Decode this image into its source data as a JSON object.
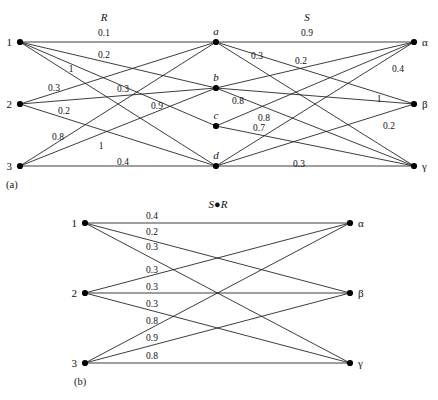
{
  "figure": {
    "panel_a": {
      "caption": "(a)",
      "relation_left_title": "R",
      "relation_right_title": "S",
      "left_nodes": [
        {
          "id": "1",
          "label": "1",
          "x": 20,
          "y": 42
        },
        {
          "id": "2",
          "label": "2",
          "x": 20,
          "y": 104
        },
        {
          "id": "3",
          "label": "3",
          "x": 20,
          "y": 166
        }
      ],
      "middle_nodes": [
        {
          "id": "a",
          "label": "a",
          "x": 216,
          "y": 42
        },
        {
          "id": "b",
          "label": "b",
          "x": 216,
          "y": 88
        },
        {
          "id": "c",
          "label": "c",
          "x": 216,
          "y": 126
        },
        {
          "id": "d",
          "label": "d",
          "x": 216,
          "y": 166
        }
      ],
      "right_nodes": [
        {
          "id": "alpha",
          "label": "α",
          "x": 414,
          "y": 42
        },
        {
          "id": "beta",
          "label": "β",
          "x": 414,
          "y": 104
        },
        {
          "id": "gamma",
          "label": "γ",
          "x": 414,
          "y": 166
        }
      ],
      "R_edges": [
        {
          "from": "1",
          "to": "a",
          "weight": "0.1"
        },
        {
          "from": "1",
          "to": "b",
          "weight": "0.2"
        },
        {
          "from": "1",
          "to": "c",
          "weight": "1"
        },
        {
          "from": "1",
          "to": "d",
          "weight": "0.3"
        },
        {
          "from": "2",
          "to": "a",
          "weight": "0.3"
        },
        {
          "from": "2",
          "to": "b",
          "weight": "0.9"
        },
        {
          "from": "2",
          "to": "d",
          "weight": "0.2"
        },
        {
          "from": "3",
          "to": "a",
          "weight": "0.8"
        },
        {
          "from": "3",
          "to": "b",
          "weight": "1"
        },
        {
          "from": "3",
          "to": "d",
          "weight": "0.4"
        }
      ],
      "S_edges": [
        {
          "from": "a",
          "to": "alpha",
          "weight": "0.9"
        },
        {
          "from": "a",
          "to": "beta",
          "weight": "0.3"
        },
        {
          "from": "a",
          "to": "gamma",
          "weight": "0.2"
        },
        {
          "from": "b",
          "to": "alpha",
          "weight": "0.4"
        },
        {
          "from": "b",
          "to": "beta",
          "weight": "1"
        },
        {
          "from": "b",
          "to": "gamma",
          "weight": "0.8"
        },
        {
          "from": "c",
          "to": "alpha",
          "weight": "0.8"
        },
        {
          "from": "c",
          "to": "gamma",
          "weight": "0.7"
        },
        {
          "from": "d",
          "to": "alpha",
          "weight": "0.2"
        },
        {
          "from": "d",
          "to": "beta",
          "weight": "0.3"
        },
        {
          "from": "d",
          "to": "gamma",
          "weight": "0.3"
        }
      ],
      "weight_labels": [
        {
          "text": "0.1",
          "x": 104,
          "y": 36
        },
        {
          "text": "0.2",
          "x": 104,
          "y": 58
        },
        {
          "text": "1",
          "x": 71,
          "y": 72
        },
        {
          "text": "0.3",
          "x": 54,
          "y": 91
        },
        {
          "text": "0.3",
          "x": 123,
          "y": 92
        },
        {
          "text": "0.9",
          "x": 157,
          "y": 109
        },
        {
          "text": "0.2",
          "x": 64,
          "y": 114
        },
        {
          "text": "0.8",
          "x": 58,
          "y": 140
        },
        {
          "text": "1",
          "x": 101,
          "y": 149
        },
        {
          "text": "0.4",
          "x": 123,
          "y": 165
        },
        {
          "text": "0.9",
          "x": 307,
          "y": 36
        },
        {
          "text": "0.3",
          "x": 257,
          "y": 59
        },
        {
          "text": "0.2",
          "x": 301,
          "y": 64
        },
        {
          "text": "0.4",
          "x": 398,
          "y": 72
        },
        {
          "text": "0.8",
          "x": 238,
          "y": 104
        },
        {
          "text": "1",
          "x": 379,
          "y": 102
        },
        {
          "text": "0.8",
          "x": 264,
          "y": 121
        },
        {
          "text": "0.7",
          "x": 259,
          "y": 131
        },
        {
          "text": "0.2",
          "x": 389,
          "y": 129
        },
        {
          "text": "0.3",
          "x": 299,
          "y": 167
        }
      ],
      "title_positions": {
        "R": {
          "x": 104,
          "y": 21
        },
        "S": {
          "x": 307,
          "y": 21
        }
      },
      "caption_position": {
        "x": 6,
        "y": 188
      }
    },
    "panel_b": {
      "caption": "(b)",
      "title": "S●R",
      "title_position": {
        "x": 218,
        "y": 208
      },
      "left_nodes": [
        {
          "id": "1",
          "label": "1",
          "x": 85,
          "y": 223
        },
        {
          "id": "2",
          "label": "2",
          "x": 85,
          "y": 293
        },
        {
          "id": "3",
          "label": "3",
          "x": 85,
          "y": 363
        }
      ],
      "right_nodes": [
        {
          "id": "alpha",
          "label": "α",
          "x": 350,
          "y": 223
        },
        {
          "id": "beta",
          "label": "β",
          "x": 350,
          "y": 293
        },
        {
          "id": "gamma",
          "label": "γ",
          "x": 350,
          "y": 363
        }
      ],
      "edges": [
        {
          "from": "1",
          "to": "alpha",
          "weight": "0.4"
        },
        {
          "from": "1",
          "to": "beta",
          "weight": "0.2"
        },
        {
          "from": "1",
          "to": "gamma",
          "weight": "0.3"
        },
        {
          "from": "2",
          "to": "alpha",
          "weight": "0.3"
        },
        {
          "from": "2",
          "to": "beta",
          "weight": "0.3"
        },
        {
          "from": "2",
          "to": "gamma",
          "weight": "0.3"
        },
        {
          "from": "3",
          "to": "alpha",
          "weight": "0.8"
        },
        {
          "from": "3",
          "to": "beta",
          "weight": "0.9"
        },
        {
          "from": "3",
          "to": "gamma",
          "weight": "0.8"
        }
      ],
      "weight_labels": [
        {
          "text": "0.4",
          "x": 152,
          "y": 219
        },
        {
          "text": "0.2",
          "x": 152,
          "y": 235
        },
        {
          "text": "0.3",
          "x": 152,
          "y": 250
        },
        {
          "text": "0.3",
          "x": 152,
          "y": 273
        },
        {
          "text": "0.3",
          "x": 152,
          "y": 290
        },
        {
          "text": "0.3",
          "x": 152,
          "y": 307
        },
        {
          "text": "0.8",
          "x": 152,
          "y": 324
        },
        {
          "text": "0.9",
          "x": 152,
          "y": 341
        },
        {
          "text": "0.8",
          "x": 152,
          "y": 359
        }
      ],
      "caption_position": {
        "x": 74,
        "y": 385
      }
    },
    "colors": {
      "line": "#1a1a1a",
      "node": "#000000",
      "text": "#111111",
      "background": "#ffffff"
    }
  }
}
